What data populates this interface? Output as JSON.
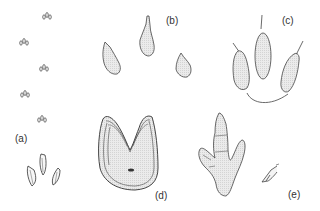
{
  "figure": {
    "panels": [
      {
        "id": "a",
        "label": "(a)",
        "description": "trackway of small tridactyl prints with enlarged print"
      },
      {
        "id": "b",
        "label": "(b)",
        "description": "three separate toe prints"
      },
      {
        "id": "c",
        "label": "(c)",
        "description": "three elongated toe impressions with claw marks and heel curve"
      },
      {
        "id": "d",
        "label": "(d)",
        "description": "U-shaped print with concentric outlines"
      },
      {
        "id": "e",
        "label": "(e)",
        "description": "large tridactyl print with segmented toes and small print"
      }
    ],
    "colors": {
      "stroke": "#444444",
      "fill": "#e6e6e6",
      "background": "#ffffff"
    }
  }
}
